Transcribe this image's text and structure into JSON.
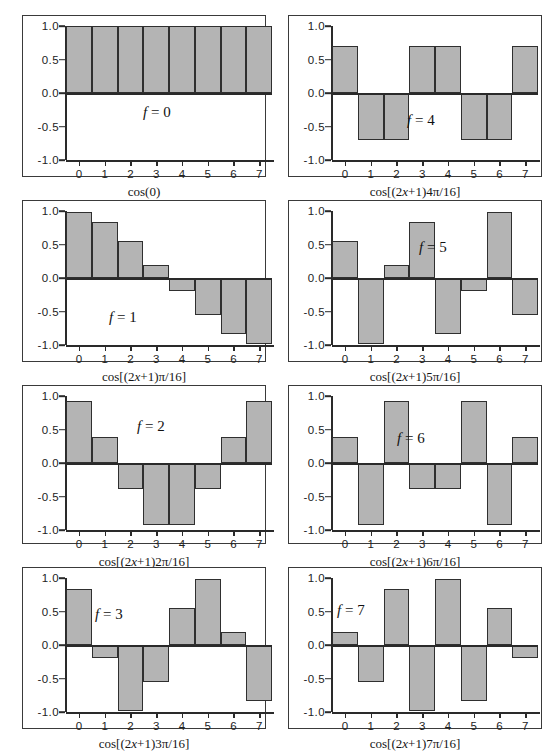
{
  "figure": {
    "bar_fill_color": "#b4b4b4",
    "bar_edge_color": "#2f2f2f",
    "axis_color": "#2a2a2a",
    "background_color": "#ffffff"
  },
  "axis": {
    "y_ticks": [
      "1.0",
      "0.5",
      "0.0",
      "-0.5",
      "-1.0"
    ],
    "y_values": [
      1.0,
      0.5,
      0.0,
      -0.5,
      -1.0
    ],
    "x_ticks": [
      "0",
      "1",
      "2",
      "3",
      "4",
      "5",
      "6",
      "7"
    ],
    "ylim": [
      -1.0,
      1.0
    ]
  },
  "chart_data": [
    {
      "type": "bar",
      "panel_index": 0,
      "title": "f = 0",
      "f_value": "0",
      "f_prefix": "f",
      "f_eq": " = 0",
      "xlabel": "cos(0)",
      "xlabel_parts": {
        "pre": "cos(0)",
        "italic": "",
        "post": ""
      },
      "categories": [
        "0",
        "1",
        "2",
        "3",
        "4",
        "5",
        "6",
        "7"
      ],
      "values": [
        1.0,
        1.0,
        1.0,
        1.0,
        1.0,
        1.0,
        1.0,
        1.0
      ],
      "ylim": [
        -1.0,
        1.0
      ],
      "grid": false,
      "label_pos": {
        "left": 120,
        "top": 88
      }
    },
    {
      "type": "bar",
      "panel_index": 1,
      "title": "f = 4",
      "f_value": "4",
      "f_prefix": "f",
      "f_eq": " = 4",
      "xlabel": "cos[(2x+1)4π/16]",
      "xlabel_parts": {
        "pre": "cos[(2",
        "italic": "x",
        "post": "+1)4π/16]"
      },
      "categories": [
        "0",
        "1",
        "2",
        "3",
        "4",
        "5",
        "6",
        "7"
      ],
      "values": [
        0.707,
        -0.707,
        -0.707,
        0.707,
        0.707,
        -0.707,
        -0.707,
        0.707
      ],
      "ylim": [
        -1.0,
        1.0
      ],
      "grid": false,
      "label_pos": {
        "left": 118,
        "top": 96
      }
    },
    {
      "type": "bar",
      "panel_index": 2,
      "title": "f = 1",
      "f_value": "1",
      "f_prefix": "f",
      "f_eq": " = 1",
      "xlabel": "cos[(2x+1)π/16]",
      "xlabel_parts": {
        "pre": "cos[(2",
        "italic": "x",
        "post": "+1)π/16]"
      },
      "categories": [
        "0",
        "1",
        "2",
        "3",
        "4",
        "5",
        "6",
        "7"
      ],
      "values": [
        0.981,
        0.831,
        0.556,
        0.195,
        -0.195,
        -0.556,
        -0.831,
        -0.981
      ],
      "ylim": [
        -1.0,
        1.0
      ],
      "grid": false,
      "label_pos": {
        "left": 86,
        "top": 108
      }
    },
    {
      "type": "bar",
      "panel_index": 3,
      "title": "f = 5",
      "f_value": "5",
      "f_prefix": "f",
      "f_eq": " = 5",
      "xlabel": "cos[(2x+1)5π/16]",
      "xlabel_parts": {
        "pre": "cos[(2",
        "italic": "x",
        "post": "+1)5π/16]"
      },
      "categories": [
        "0",
        "1",
        "2",
        "3",
        "4",
        "5",
        "6",
        "7"
      ],
      "values": [
        0.556,
        -0.981,
        0.195,
        0.831,
        -0.831,
        -0.195,
        0.981,
        -0.556
      ],
      "ylim": [
        -1.0,
        1.0
      ],
      "grid": false,
      "label_pos": {
        "left": 130,
        "top": 38
      }
    },
    {
      "type": "bar",
      "panel_index": 4,
      "title": "f = 2",
      "f_value": "2",
      "f_prefix": "f",
      "f_eq": " = 2",
      "xlabel": "cos[(2x+1)2π/16]",
      "xlabel_parts": {
        "pre": "cos[(2",
        "italic": "x",
        "post": "+1)2π/16]"
      },
      "categories": [
        "0",
        "1",
        "2",
        "3",
        "4",
        "5",
        "6",
        "7"
      ],
      "values": [
        0.924,
        0.383,
        -0.383,
        -0.924,
        -0.924,
        -0.383,
        0.383,
        0.924
      ],
      "ylim": [
        -1.0,
        1.0
      ],
      "grid": false,
      "label_pos": {
        "left": 114,
        "top": 32
      }
    },
    {
      "type": "bar",
      "panel_index": 5,
      "title": "f = 6",
      "f_value": "6",
      "f_prefix": "f",
      "f_eq": " = 6",
      "xlabel": "cos[(2x+1)6π/16]",
      "xlabel_parts": {
        "pre": "cos[(2",
        "italic": "x",
        "post": "+1)6π/16]"
      },
      "categories": [
        "0",
        "1",
        "2",
        "3",
        "4",
        "5",
        "6",
        "7"
      ],
      "values": [
        0.383,
        -0.924,
        0.924,
        -0.383,
        -0.383,
        0.924,
        -0.924,
        0.383
      ],
      "ylim": [
        -1.0,
        1.0
      ],
      "grid": false,
      "label_pos": {
        "left": 108,
        "top": 44
      }
    },
    {
      "type": "bar",
      "panel_index": 6,
      "title": "f = 3",
      "f_value": "3",
      "f_prefix": "f",
      "f_eq": " = 3",
      "xlabel": "cos[(2x+1)3π/16]",
      "xlabel_parts": {
        "pre": "cos[(2",
        "italic": "x",
        "post": "+1)3π/16]"
      },
      "categories": [
        "0",
        "1",
        "2",
        "3",
        "4",
        "5",
        "6",
        "7"
      ],
      "values": [
        0.831,
        -0.195,
        -0.981,
        -0.556,
        0.556,
        0.981,
        0.195,
        -0.831
      ],
      "ylim": [
        -1.0,
        1.0
      ],
      "grid": false,
      "label_pos": {
        "left": 72,
        "top": 38
      }
    },
    {
      "type": "bar",
      "panel_index": 7,
      "title": "f = 7",
      "f_value": "7",
      "f_prefix": "f",
      "f_eq": " = 7",
      "xlabel": "cos[(2x+1)7π/16]",
      "xlabel_parts": {
        "pre": "cos[(2",
        "italic": "x",
        "post": "+1)7π/16]"
      },
      "categories": [
        "0",
        "1",
        "2",
        "3",
        "4",
        "5",
        "6",
        "7"
      ],
      "values": [
        0.195,
        -0.556,
        0.831,
        -0.981,
        0.981,
        -0.831,
        0.556,
        -0.195
      ],
      "ylim": [
        -1.0,
        1.0
      ],
      "grid": false,
      "label_pos": {
        "left": 48,
        "top": 34
      }
    }
  ]
}
